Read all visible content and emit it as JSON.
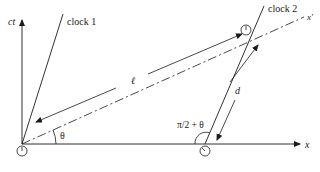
{
  "diagram": {
    "axes": {
      "vertical_label": "ct",
      "horizontal_label": "x",
      "primed_axis_label": "x′"
    },
    "worldlines": {
      "clock1_label": "clock 1",
      "clock2_label": "clock 2"
    },
    "measurements": {
      "length_label": "ℓ",
      "distance_label": "d",
      "angle_label": "θ",
      "obtuse_angle_label": "π/2 + θ"
    },
    "colors": {
      "line": "#1a1a1a",
      "background": "#ffffff"
    }
  }
}
